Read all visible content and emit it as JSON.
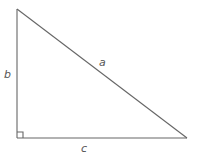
{
  "diagram": {
    "type": "right-triangle",
    "stroke_color": "#666666",
    "label_color": "#555555",
    "vertices": {
      "top": [
        17,
        9
      ],
      "right_angle": [
        17,
        138
      ],
      "right": [
        187,
        138
      ]
    },
    "sides": [
      {
        "id": "a",
        "label": "a",
        "description": "hypotenuse"
      },
      {
        "id": "b",
        "label": "b",
        "description": "vertical leg"
      },
      {
        "id": "c",
        "label": "c",
        "description": "horizontal leg"
      }
    ],
    "right_angle_marker": true
  }
}
